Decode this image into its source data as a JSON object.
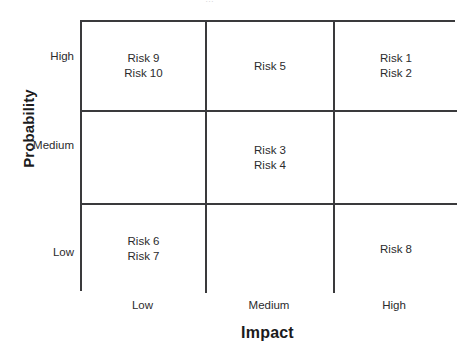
{
  "figure": {
    "top_clipped_text": "…",
    "axes": {
      "x": {
        "title": "Impact",
        "ticks": [
          "Low",
          "Medium",
          "High"
        ]
      },
      "y": {
        "title": "Probability",
        "ticks": [
          "High",
          "Medium",
          "Low"
        ]
      }
    }
  },
  "chart_data": {
    "type": "heatmap",
    "title": "",
    "xlabel": "Impact",
    "ylabel": "Probability",
    "x_categories": [
      "Low",
      "Medium",
      "High"
    ],
    "y_categories": [
      "High",
      "Medium",
      "Low"
    ],
    "grid": true,
    "legend": "none",
    "cells": [
      {
        "row": "High",
        "col": "Low",
        "items": [
          "Risk 9",
          "Risk 10"
        ]
      },
      {
        "row": "High",
        "col": "Medium",
        "items": [
          "Risk 5"
        ]
      },
      {
        "row": "High",
        "col": "High",
        "items": [
          "Risk 1",
          "Risk 2"
        ]
      },
      {
        "row": "Medium",
        "col": "Low",
        "items": []
      },
      {
        "row": "Medium",
        "col": "Medium",
        "items": [
          "Risk 3",
          "Risk 4"
        ]
      },
      {
        "row": "Medium",
        "col": "High",
        "items": []
      },
      {
        "row": "Low",
        "col": "Low",
        "items": [
          "Risk 6",
          "Risk 7"
        ]
      },
      {
        "row": "Low",
        "col": "Medium",
        "items": []
      },
      {
        "row": "Low",
        "col": "High",
        "items": [
          "Risk 8"
        ]
      }
    ],
    "cell_text": {
      "r0c0_l0": "Risk 9",
      "r0c0_l1": "Risk 10",
      "r0c1_l0": "Risk 5",
      "r0c2_l0": "Risk 1",
      "r0c2_l1": "Risk 2",
      "r1c1_l0": "Risk 3",
      "r1c1_l1": "Risk 4",
      "r2c0_l0": "Risk 6",
      "r2c0_l1": "Risk 7",
      "r2c2_l0": "Risk 8"
    },
    "colors": {
      "cell_background": "#ffffff",
      "grid_line": "#3a3a3c",
      "text": "#2b2b2d",
      "axis_title": "#1b1b1c"
    }
  }
}
